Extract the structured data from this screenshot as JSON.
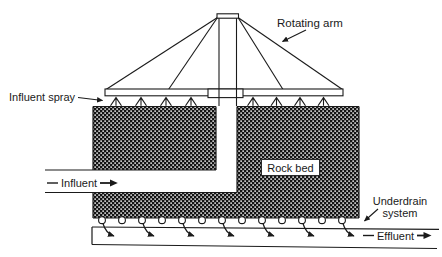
{
  "figure": {
    "labels": {
      "rotating_arm": "Rotating arm",
      "influent_spray": "Influent spray",
      "influent": "Influent",
      "rock_bed": "Rock bed",
      "underdrain_system": "Underdrain system",
      "effluent": "Effluent"
    },
    "colors": {
      "background": "#ffffff",
      "line": "#1a1a1a",
      "rock_pattern_dark": "#141414",
      "rock_pattern_light": "#ededed"
    }
  }
}
